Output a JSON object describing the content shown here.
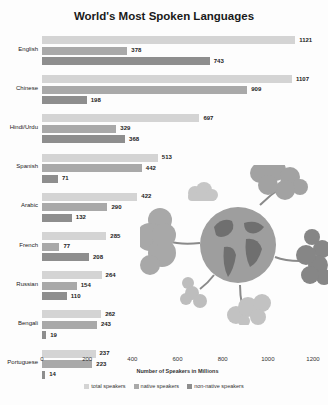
{
  "chart_data": {
    "type": "bar",
    "orientation": "horizontal",
    "title": "World's Most Spoken Languages",
    "xlabel": "Number of Speakers in Millions",
    "ylabel": "",
    "xlim": [
      0,
      1200
    ],
    "x_ticks": [
      "0",
      "200",
      "400",
      "600",
      "800",
      "1000",
      "1200"
    ],
    "grid": false,
    "legend_position": "bottom",
    "categories": [
      "English",
      "Chinese",
      "Hindi/Urdu",
      "Spanish",
      "Arabic",
      "French",
      "Russian",
      "Bengali",
      "Portuguese"
    ],
    "series": [
      {
        "name": "total speakers",
        "color": "#d4d4d4",
        "values": [
          1121,
          1107,
          697,
          513,
          422,
          285,
          264,
          262,
          237
        ]
      },
      {
        "name": "native speakers",
        "color": "#a9a9a9",
        "values": [
          378,
          909,
          329,
          442,
          290,
          77,
          154,
          243,
          223
        ]
      },
      {
        "name": "non-native speakers",
        "color": "#8e8e8e",
        "values": [
          743,
          198,
          368,
          71,
          132,
          208,
          110,
          19,
          14
        ]
      }
    ]
  },
  "title": "World's Most Spoken Languages",
  "xlabel": "Number of Speakers in Millions",
  "ticks": [
    "0",
    "200",
    "400",
    "600",
    "800",
    "1000",
    "1200"
  ],
  "legend": [
    "total speakers",
    "native speakers",
    "non-native speakers"
  ]
}
